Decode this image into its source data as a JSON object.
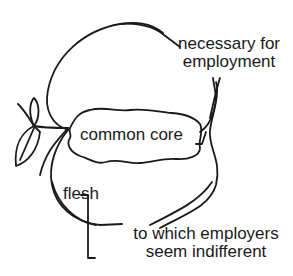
{
  "diagram": {
    "title": "",
    "labels": {
      "necessary_line1": "necessary for",
      "necessary_line2": "employment",
      "common_core": "common core",
      "flesh": "flesh",
      "indifferent_line1": "to which employers",
      "indifferent_line2": "seem indifferent"
    },
    "shapes": {
      "outer": "apple outline (flesh)",
      "inner": "wavy common core",
      "leaf": "leaf and stem"
    },
    "colors": {
      "ink": "#1a1a1a",
      "background": "#ffffff"
    }
  }
}
